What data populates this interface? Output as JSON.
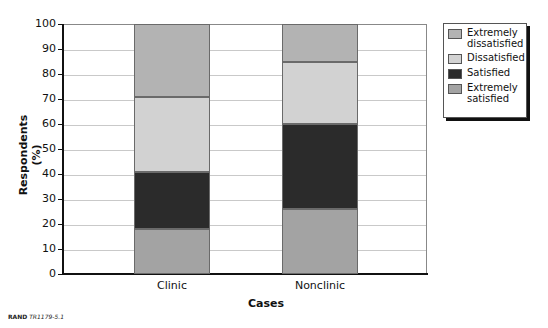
{
  "chart_data": {
    "type": "bar",
    "stacked": true,
    "title": "",
    "xlabel": "Cases",
    "ylabel": "Respondents (%)",
    "ylim": [
      0,
      100
    ],
    "yticks": [
      0,
      10,
      20,
      30,
      40,
      50,
      60,
      70,
      80,
      90,
      100
    ],
    "grid": true,
    "legend_position": "right",
    "categories": [
      "Clinic",
      "Nonclinic"
    ],
    "series": [
      {
        "name": "Extremely satisfied",
        "color": "#a3a3a3",
        "values": [
          18,
          26
        ]
      },
      {
        "name": "Satisfied",
        "color": "#2b2b2b",
        "values": [
          23,
          34
        ]
      },
      {
        "name": "Dissatisfied",
        "color": "#d2d2d2",
        "values": [
          30,
          25
        ]
      },
      {
        "name": "Extremely dissatisfied",
        "color": "#b3b3b3",
        "values": [
          29,
          15
        ]
      }
    ]
  },
  "legend": {
    "items": [
      {
        "label_line1": "Extremely",
        "label_line2": "dissatisfied",
        "color": "#b3b3b3"
      },
      {
        "label_line1": "Dissatisfied",
        "label_line2": "",
        "color": "#d2d2d2"
      },
      {
        "label_line1": "Satisfied",
        "label_line2": "",
        "color": "#2b2b2b"
      },
      {
        "label_line1": "Extremely",
        "label_line2": "satisfied",
        "color": "#a3a3a3"
      }
    ]
  },
  "source": {
    "org": "RAND",
    "id": "TR1179-5.1"
  }
}
